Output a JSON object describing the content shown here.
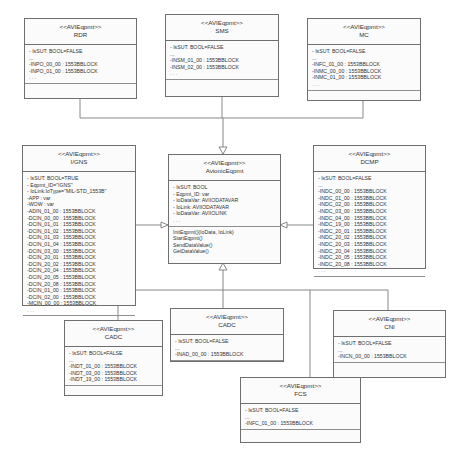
{
  "diagram": {
    "type": "UML class diagram",
    "classes": {
      "rdr": {
        "stereotype": "<<AVIEqpmt>>",
        "name": "RDR",
        "attributes": [
          "- IsSUT: BOOL=FALSE",
          "...",
          "-INPO_00_00 : 1553BBLOCK",
          "-INPO_01_00 : 1553BBLOCK",
          ". . ."
        ],
        "operations": []
      },
      "sms": {
        "stereotype": "<<AVIEqpmt>>",
        "name": "SMS",
        "attributes": [
          "- IsSUT: BOOL=FALSE",
          "...",
          "-INSM_01_00 : 1553BBLOCK",
          "-INSM_02_00 : 1553BBLOCK",
          ". . ."
        ],
        "operations": []
      },
      "mc": {
        "stereotype": "<<AVIEqpmt>>",
        "name": "MC",
        "attributes": [
          "- IsSUT: BOOL=FALSE",
          "...",
          "-INFC_01_00 : 1553BBLOCK",
          "-INMC_00_00 : 1553BBLOCK",
          "-INMC_01_00 : 1553BBLOCK",
          ". . ."
        ],
        "operations": []
      },
      "igns": {
        "stereotype": "<<AVIEqpmt>>",
        "name": "I/GNS",
        "attributes": [
          "- IsSUT: BOOL=TRUE",
          "- Eqpmt_ID=\"IGNS\"",
          "- IoLink.IoType=\"MIL-STD_1553B\"",
          "-APP : var",
          "-WOW : var",
          "-ADIN_01_00 : 1553BBLOCK",
          "-DCIN_00_00 : 1553BBLOCK",
          "-DCIN_01_01 : 1553BBLOCK",
          "-DCIN_01_02 : 1553BBLOCK",
          "-DCIN_01_03 : 1553BBLOCK",
          "-DCIN_01_04 : 1553BBLOCK",
          "-DCIN_03_00 : 1553BBLOCK",
          "-DCIN_20_01 : 1553BBLOCK",
          "-DCIN_20_02 : 1553BBLOCK",
          "-DCIN_20_04 : 1553BBLOCK",
          "-DCIN_20_05 : 1553BBLOCK",
          "-DCIN_20_08 : 1553BBLOCK",
          "-DCIN_01_00 : 1553BBLOCK",
          "-DCIN_02_00 : 1553BBLOCK",
          "-MCIN_00_00 : 1553BBLOCK",
          ". . ."
        ],
        "operations": []
      },
      "avionic": {
        "stereotype": "<<AVIEqpmt>>",
        "name": "AvionicEqpmt",
        "attributes": [
          "- IsSUT: BOOL",
          "- Eqpmt_ID: var",
          "- IoDataVar: AVIIODATAVAR",
          "- IoLink: AVIIODATAVAR",
          "- IoDataVar: AVIIOLINK",
          ". . ."
        ],
        "operations": [
          "InitEqpmt(){IoData, IoLink}",
          "StartEqpmt()",
          "SendDataValue()",
          "GetDataValue()"
        ]
      },
      "dcmp": {
        "stereotype": "<<AVIEqpmt>>",
        "name": "DCMP",
        "attributes": [
          "- IsSUT: BOOL=FALSE",
          "...",
          "-INDC_00_00 : 1553BBLOCK",
          "-INDC_01_00 : 1553BBLOCK",
          "-INDC_02_00 : 1553BBLOCK",
          "-INDC_03_00 : 1553BBLOCK",
          "-INDC_04_00 : 1553BBLOCK",
          "-INDC_19_00 : 1553BBLOCK",
          "-INDC_20_01 : 1553BBLOCK",
          "-INDC_20_02 : 1553BBLOCK",
          "-INDC_20_03 : 1553BBLOCK",
          "-INDC_20_04 : 1553BBLOCK",
          "-INDC_20_05 : 1553BBLOCK",
          "-INDC_20_08 : 1553BBLOCK",
          ". . ."
        ],
        "operations": []
      },
      "cadc_left": {
        "stereotype": "<<AVIEqpmt>>",
        "name": "CADC",
        "attributes": [
          "- IsSUT: BOOL=FALSE",
          "...",
          "-INDT_01_00 : 1553BBLOCK",
          "-INDT_03_00 : 1553BBLOCK",
          "-INDT_19_00 : 1553BBLOCK"
        ],
        "operations": []
      },
      "cadc_mid": {
        "stereotype": "<<AVIEqpmt>>",
        "name": "CADC",
        "attributes": [
          "- IsSUT: BOOL=FALSE",
          "...",
          "-INAD_00_00 : 1553BBLOCK"
        ],
        "operations": []
      },
      "cni": {
        "stereotype": "<<AVIEqpmt>>",
        "name": "CNI",
        "attributes": [
          "- IsSUT: BOOL=FALSE",
          "...",
          "-INCN_00_00 : 1553BBLOCK"
        ],
        "operations": []
      },
      "fcs": {
        "stereotype": "<<AVIEqpmt>>",
        "name": "FCS",
        "attributes": [
          "- IsSUT: BOOL=FALSE",
          "...",
          "-INFC_01_00 : 1553BBLOCK"
        ],
        "operations": []
      }
    },
    "relationships": [
      {
        "type": "generalization",
        "from": "RDR",
        "to": "AvionicEqpmt"
      },
      {
        "type": "generalization",
        "from": "SMS",
        "to": "AvionicEqpmt"
      },
      {
        "type": "generalization",
        "from": "MC",
        "to": "AvionicEqpmt"
      },
      {
        "type": "generalization",
        "from": "I/GNS",
        "to": "AvionicEqpmt"
      },
      {
        "type": "generalization",
        "from": "DCMP",
        "to": "AvionicEqpmt"
      },
      {
        "type": "generalization",
        "from": "CADC",
        "to": "AvionicEqpmt"
      },
      {
        "type": "generalization",
        "from": "CADC",
        "to": "AvionicEqpmt"
      },
      {
        "type": "generalization",
        "from": "CNI",
        "to": "AvionicEqpmt"
      },
      {
        "type": "generalization",
        "from": "FCS",
        "to": "AvionicEqpmt"
      }
    ],
    "colors": {
      "background": "#ffffff",
      "box_fill": "#fbfbfb",
      "border": "#6f6f6f",
      "line": "#7a7a7a",
      "text": "#333333"
    }
  }
}
